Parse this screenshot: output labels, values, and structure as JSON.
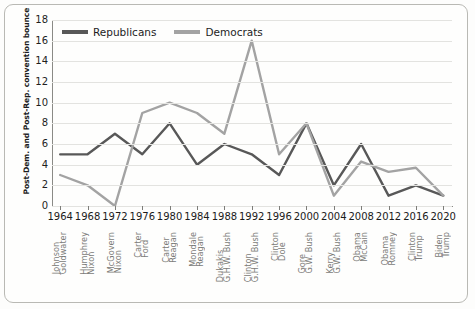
{
  "chart_data": {
    "type": "line",
    "title": "",
    "xlabel": "",
    "ylabel": "Post-Dem. and Post-Rep. convention bounce",
    "ylim": [
      0,
      18
    ],
    "yticks": [
      0,
      2,
      4,
      6,
      8,
      10,
      12,
      14,
      16,
      18
    ],
    "grid": true,
    "legend_position": "top-left",
    "categories": [
      "1964",
      "1968",
      "1972",
      "1976",
      "1980",
      "1984",
      "1988",
      "1992",
      "1996",
      "2000",
      "2004",
      "2008",
      "2012",
      "2016",
      "2020"
    ],
    "candidates": [
      {
        "dem": "Johnson",
        "rep": "Goldwater"
      },
      {
        "dem": "Humphrey",
        "rep": "Nixon"
      },
      {
        "dem": "McGovern",
        "rep": "Nixon"
      },
      {
        "dem": "Carter",
        "rep": "Ford"
      },
      {
        "dem": "Carter",
        "rep": "Reagan"
      },
      {
        "dem": "Mondale",
        "rep": "Reagan"
      },
      {
        "dem": "Dukakis",
        "rep": "G.H.W. Bush"
      },
      {
        "dem": "Clinton",
        "rep": "G.H.W. Bush"
      },
      {
        "dem": "Clinton",
        "rep": "Dole"
      },
      {
        "dem": "Gore",
        "rep": "G.W. Bush"
      },
      {
        "dem": "Kerry",
        "rep": "G.W. Bush"
      },
      {
        "dem": "Obama",
        "rep": "McCain"
      },
      {
        "dem": "Obama",
        "rep": "Romney"
      },
      {
        "dem": "Clinton",
        "rep": "Trump"
      },
      {
        "dem": "Biden",
        "rep": "Trump"
      }
    ],
    "series": [
      {
        "name": "Republicans",
        "color": "#585858",
        "values": [
          5,
          5,
          7,
          5,
          8,
          4,
          6,
          5,
          3,
          8,
          2,
          6,
          1,
          2,
          1
        ]
      },
      {
        "name": "Democrats",
        "color": "#a3a3a3",
        "values": [
          3,
          2,
          0,
          9,
          10,
          9,
          7,
          16,
          5,
          8,
          1,
          4.3,
          3.3,
          3.7,
          1
        ]
      }
    ]
  },
  "legend": {
    "items": [
      {
        "label": "Republicans"
      },
      {
        "label": "Democrats"
      }
    ]
  }
}
